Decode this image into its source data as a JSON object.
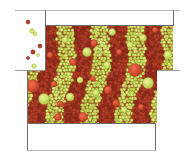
{
  "diagram": {
    "type": "granular-flow-simulation",
    "colors": {
      "background": "#ffffff",
      "wall": "#6b6b6b",
      "wall_light": "#b8b8b8",
      "red_dark": "#8e2b1c",
      "red_mid": "#b5402a",
      "red_bright": "#e2563a",
      "green_dark": "#9fb83c",
      "green_mid": "#c4d957",
      "green_bright": "#dcea79",
      "bed_fill": "#a9432a"
    },
    "bands": {
      "count": 9,
      "order": [
        "red",
        "green",
        "red",
        "green",
        "red",
        "green",
        "red",
        "green",
        "red"
      ]
    },
    "regions": {
      "top_box": {
        "x": 45,
        "y": 10,
        "w": 128,
        "h": 15
      },
      "upper_bed": {
        "x": 45,
        "y": 25,
        "w": 128,
        "h": 45
      },
      "lower_bed": {
        "x": 27,
        "y": 70,
        "w": 130,
        "h": 53
      },
      "bottom_box": {
        "x": 27,
        "y": 123,
        "w": 128,
        "h": 27
      },
      "chute": {
        "x": 15,
        "y": 10,
        "w": 30,
        "h": 60
      }
    },
    "falling_particles": [
      {
        "x": 28,
        "y": 22,
        "r": 2.0,
        "c": "red"
      },
      {
        "x": 32,
        "y": 31,
        "r": 2.4,
        "c": "green"
      },
      {
        "x": 35,
        "y": 34,
        "r": 1.8,
        "c": "green"
      },
      {
        "x": 40,
        "y": 46,
        "r": 2.0,
        "c": "red"
      },
      {
        "x": 33,
        "y": 52,
        "r": 2.2,
        "c": "red"
      },
      {
        "x": 38,
        "y": 55,
        "r": 1.5,
        "c": "green"
      },
      {
        "x": 28,
        "y": 58,
        "r": 1.6,
        "c": "red"
      },
      {
        "x": 34,
        "y": 66,
        "r": 2.2,
        "c": "green"
      }
    ]
  }
}
